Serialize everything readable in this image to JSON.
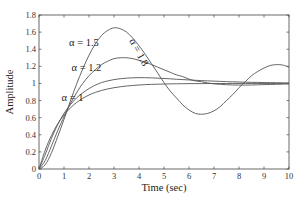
{
  "chart_data": {
    "type": "line",
    "title": "",
    "xlabel": "Time (sec)",
    "ylabel": "Amplitude",
    "xlim": [
      0,
      10
    ],
    "ylim": [
      0,
      1.8
    ],
    "grid": false,
    "legend": "none (inline annotations)",
    "xticks": [
      "0",
      "1",
      "2",
      "3",
      "4",
      "5",
      "6",
      "7",
      "8",
      "9",
      "10"
    ],
    "yticks": [
      "0",
      "0.2",
      "0.4",
      "0.6",
      "0.8",
      "1",
      "1.2",
      "1.4",
      "1.6",
      "1.8"
    ],
    "x": [
      0,
      0.25,
      0.5,
      0.75,
      1,
      1.25,
      1.5,
      1.75,
      2,
      2.25,
      2.5,
      2.75,
      3,
      3.25,
      3.5,
      3.75,
      4,
      4.25,
      4.5,
      4.75,
      5,
      5.25,
      5.5,
      5.75,
      6,
      6.25,
      6.5,
      6.75,
      7,
      7.25,
      7.5,
      7.75,
      8,
      8.25,
      8.5,
      8.75,
      9,
      9.25,
      9.5,
      9.75,
      10
    ],
    "series": [
      {
        "name": "α = 1",
        "values": [
          0,
          0.221,
          0.393,
          0.528,
          0.632,
          0.713,
          0.777,
          0.826,
          0.865,
          0.895,
          0.918,
          0.936,
          0.95,
          0.961,
          0.97,
          0.976,
          0.982,
          0.986,
          0.989,
          0.991,
          0.993,
          0.995,
          0.996,
          0.997,
          0.998,
          0.998,
          0.998,
          0.999,
          0.999,
          0.999,
          0.999,
          1.0,
          1.0,
          1.0,
          1.0,
          1.0,
          1.0,
          1.0,
          1.0,
          1.0,
          1.0
        ]
      },
      {
        "name": "α = 1.2",
        "values": [
          0,
          0.17,
          0.36,
          0.52,
          0.65,
          0.75,
          0.83,
          0.89,
          0.94,
          0.98,
          1.01,
          1.03,
          1.045,
          1.055,
          1.062,
          1.066,
          1.068,
          1.067,
          1.065,
          1.062,
          1.058,
          1.054,
          1.049,
          1.045,
          1.041,
          1.037,
          1.033,
          1.03,
          1.027,
          1.024,
          1.021,
          1.019,
          1.017,
          1.015,
          1.013,
          1.012,
          1.01,
          1.009,
          1.008,
          1.007,
          1.006
        ]
      },
      {
        "name": "α = 1.5",
        "values": [
          0,
          0.1,
          0.27,
          0.45,
          0.61,
          0.76,
          0.89,
          1.0,
          1.09,
          1.16,
          1.22,
          1.26,
          1.29,
          1.3,
          1.3,
          1.29,
          1.27,
          1.25,
          1.22,
          1.19,
          1.16,
          1.13,
          1.1,
          1.08,
          1.05,
          1.03,
          1.02,
          1.005,
          0.995,
          0.99,
          0.985,
          0.982,
          0.981,
          0.981,
          0.982,
          0.984,
          0.986,
          0.988,
          0.99,
          0.992,
          0.994
        ]
      },
      {
        "name": "α = 1.8",
        "values": [
          0,
          0.05,
          0.19,
          0.38,
          0.58,
          0.79,
          0.99,
          1.17,
          1.33,
          1.46,
          1.56,
          1.62,
          1.65,
          1.64,
          1.6,
          1.53,
          1.44,
          1.34,
          1.23,
          1.12,
          1.01,
          0.91,
          0.83,
          0.75,
          0.69,
          0.65,
          0.64,
          0.65,
          0.68,
          0.73,
          0.8,
          0.87,
          0.95,
          1.02,
          1.09,
          1.14,
          1.18,
          1.21,
          1.22,
          1.215,
          1.19
        ]
      }
    ],
    "annotations": [
      {
        "text": "α = 1",
        "x": 0.9,
        "y": 0.8
      },
      {
        "text": "α = 1.2",
        "x": 1.3,
        "y": 1.14
      },
      {
        "text": "α = 1.5",
        "x": 1.2,
        "y": 1.44
      },
      {
        "text": "α = 1.8",
        "x": 3.6,
        "y": 1.5,
        "rotation": 62
      }
    ]
  }
}
